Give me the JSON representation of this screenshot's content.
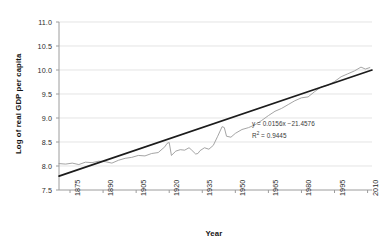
{
  "chart_data": {
    "type": "line",
    "title": "",
    "xlabel": "Year",
    "ylabel": "Log of real GDP per capita",
    "xlim": [
      1870,
      2012
    ],
    "ylim": [
      7.5,
      11.0
    ],
    "grid": true,
    "legend": "none",
    "y_ticks": [
      "11.0",
      "10.5",
      "10.0",
      "9.5",
      "9.0",
      "8.5",
      "8.0",
      "7.5"
    ],
    "y_tick_values": [
      11.0,
      10.5,
      10.0,
      9.5,
      9.0,
      8.5,
      8.0,
      7.5
    ],
    "x_ticks": [
      "1875",
      "1890",
      "1905",
      "1920",
      "1935",
      "1950",
      "1965",
      "1980",
      "1995",
      "2010"
    ],
    "x_tick_values": [
      1875,
      1890,
      1905,
      1920,
      1935,
      1950,
      1965,
      1980,
      1995,
      2010
    ],
    "annotations": {
      "equation": "y = 0.0156x −21.4576",
      "r_squared_prefix": "R",
      "r_squared_sup": "2",
      "r_squared_value": " = 0.9445"
    },
    "colors": {
      "data_series": "#9a9a9a",
      "trend_line": "#1c1c1c",
      "gridline": "#d9d9d9",
      "axis": "#9c9c9c",
      "text": "#2b2b2b"
    },
    "series": [
      {
        "name": "Log of real GDP per capita",
        "type": "line",
        "color": "#9a9a9a",
        "x": [
          1870,
          1873,
          1876,
          1879,
          1882,
          1885,
          1888,
          1891,
          1894,
          1897,
          1900,
          1903,
          1906,
          1909,
          1912,
          1915,
          1918,
          1919,
          1920,
          1921,
          1923,
          1925,
          1927,
          1929,
          1930,
          1932,
          1933,
          1934,
          1936,
          1938,
          1940,
          1942,
          1944,
          1945,
          1946,
          1948,
          1950,
          1953,
          1956,
          1959,
          1962,
          1965,
          1968,
          1971,
          1974,
          1977,
          1980,
          1983,
          1986,
          1989,
          1992,
          1995,
          1998,
          2001,
          2004,
          2007,
          2009,
          2011
        ],
        "y": [
          8.05,
          8.04,
          8.06,
          8.03,
          8.08,
          8.07,
          8.1,
          8.09,
          8.06,
          8.12,
          8.16,
          8.18,
          8.22,
          8.21,
          8.26,
          8.28,
          8.4,
          8.47,
          8.49,
          8.22,
          8.31,
          8.34,
          8.33,
          8.38,
          8.34,
          8.25,
          8.26,
          8.32,
          8.38,
          8.35,
          8.43,
          8.62,
          8.82,
          8.8,
          8.62,
          8.6,
          8.68,
          8.76,
          8.8,
          8.86,
          8.95,
          9.05,
          9.14,
          9.2,
          9.28,
          9.36,
          9.42,
          9.44,
          9.55,
          9.65,
          9.68,
          9.76,
          9.86,
          9.92,
          9.98,
          10.06,
          10.02,
          10.05
        ]
      },
      {
        "name": "Linear trend",
        "type": "line",
        "color": "#1c1c1c",
        "x": [
          1870,
          2012
        ],
        "y": [
          7.79,
          10.0
        ]
      }
    ]
  }
}
